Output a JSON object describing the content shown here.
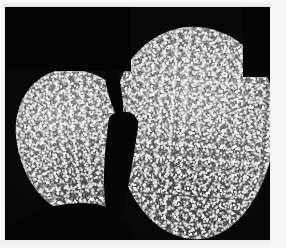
{
  "figure": {
    "kind": "grayscale-micrograph",
    "background_color": "#040404",
    "plate": {
      "x": 5,
      "y": 7,
      "width": 265,
      "height": 233
    },
    "objects": [
      {
        "name": "left-lobe",
        "label": "smaller rounded granular body",
        "fill_color": "#6a6a6a",
        "highlight_color": "#c8c8c8"
      },
      {
        "name": "right-lobe",
        "label": "larger elongated granular body",
        "fill_color": "#6b6b6b",
        "highlight_color": "#cdcdcd"
      }
    ],
    "cleft": {
      "name": "inter-lobe-cleft",
      "label": "narrow dark furrow separating the two bodies",
      "color": "#050505"
    },
    "texture": {
      "description": "dense fine speckled granular texture",
      "min_gray": "#2b2b2b",
      "max_gray": "#dcdcdc"
    }
  },
  "page": {
    "paper_color": "#f4f4f4",
    "header_text": "",
    "margin_text": "· · · · · · · · · · · · · · · · · · · · · · · · · · · · · · · · · · · ·"
  }
}
